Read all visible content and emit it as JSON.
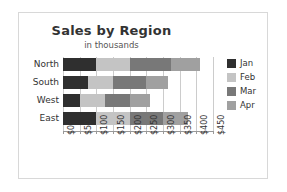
{
  "chart_data": {
    "type": "bar",
    "orientation": "horizontal",
    "stacked": true,
    "title": "Sales by Region",
    "subtitle": "in thousands",
    "xlabel": "",
    "ylabel": "",
    "categories": [
      "North",
      "South",
      "West",
      "East"
    ],
    "series": [
      {
        "name": "Jan",
        "color": "#2f2f2f",
        "values": [
          100,
          75,
          50,
          100
        ]
      },
      {
        "name": "Feb",
        "color": "#c4c4c4",
        "values": [
          100,
          75,
          75,
          100
        ]
      },
      {
        "name": "Mar",
        "color": "#787878",
        "values": [
          125,
          100,
          75,
          100
        ]
      },
      {
        "name": "Apr",
        "color": "#a0a0a0",
        "values": [
          85,
          65,
          60,
          75
        ]
      }
    ],
    "totals": [
      410,
      315,
      260,
      375
    ],
    "xlim": [
      0,
      450
    ],
    "xticks": [
      0,
      50,
      100,
      150,
      200,
      250,
      300,
      350,
      400,
      450
    ],
    "xtick_labels": [
      "$0",
      "$50",
      "$100",
      "$150",
      "$200",
      "$250",
      "$300",
      "$350",
      "$400",
      "$450"
    ],
    "grid": true,
    "legend_position": "right",
    "legend_entries": [
      "Jan",
      "Feb",
      "Mar",
      "Apr"
    ]
  },
  "colors": {
    "frame_border": "#d8d8d8",
    "gridline": "#cccccc",
    "axis": "#999999",
    "text": "#333333",
    "background": "#ffffff"
  }
}
